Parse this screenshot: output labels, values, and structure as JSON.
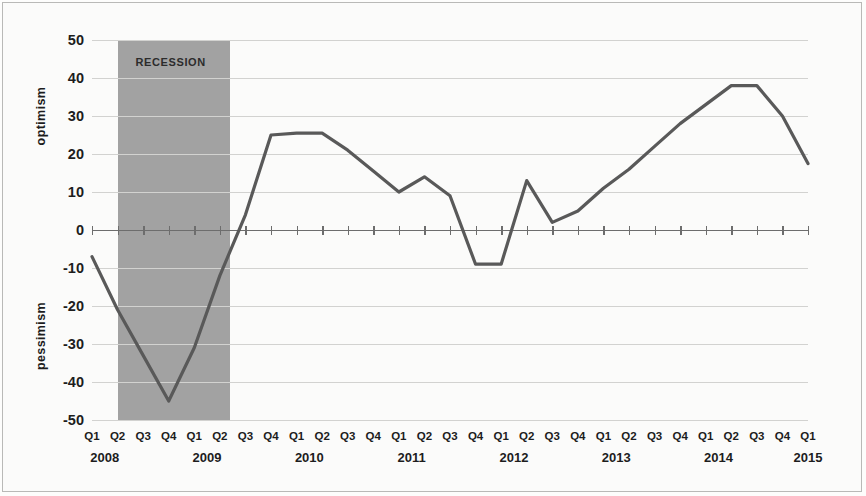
{
  "chart_data": {
    "type": "line",
    "title": "",
    "subtitle": "",
    "xlabel": "",
    "ylabel_top": "optimism",
    "ylabel_bottom": "pessimism",
    "ylim": [
      -50,
      50
    ],
    "ytick_values": [
      50,
      40,
      30,
      20,
      10,
      0,
      -10,
      -20,
      -30,
      -40,
      -50
    ],
    "ytick_labels": [
      "50",
      "40",
      "30",
      "20",
      "10",
      "0",
      "-10",
      "-20",
      "-30",
      "-40",
      "-50"
    ],
    "grid": true,
    "legend": "none",
    "line_color": "#595959",
    "band_color": "#9a9a9a",
    "quarter_labels": [
      "Q1",
      "Q2",
      "Q3",
      "Q4",
      "Q1",
      "Q2",
      "Q3",
      "Q4",
      "Q1",
      "Q2",
      "Q3",
      "Q4",
      "Q1",
      "Q2",
      "Q3",
      "Q4",
      "Q1",
      "Q2",
      "Q3",
      "Q4",
      "Q1",
      "Q2",
      "Q3",
      "Q4",
      "Q1",
      "Q2",
      "Q3",
      "Q4",
      "Q1"
    ],
    "year_labels": [
      "2008",
      "2009",
      "2010",
      "2011",
      "2012",
      "2013",
      "2014",
      "2015"
    ],
    "year_positions": [
      0.5,
      4.5,
      8.5,
      12.5,
      16.5,
      20.5,
      24.5,
      28
    ],
    "categories": [
      "Q1 2008",
      "Q2 2008",
      "Q3 2008",
      "Q4 2008",
      "Q1 2009",
      "Q2 2009",
      "Q3 2009",
      "Q4 2009",
      "Q1 2010",
      "Q2 2010",
      "Q3 2010",
      "Q4 2010",
      "Q1 2011",
      "Q2 2011",
      "Q3 2011",
      "Q4 2011",
      "Q1 2012",
      "Q2 2012",
      "Q3 2012",
      "Q4 2012",
      "Q1 2013",
      "Q2 2013",
      "Q3 2013",
      "Q4 2013",
      "Q1 2014",
      "Q2 2014",
      "Q3 2014",
      "Q4 2014",
      "Q1 2015"
    ],
    "values": [
      -7,
      -21,
      -33,
      -45,
      -31,
      -12,
      4,
      25,
      25.5,
      25.5,
      21,
      15.5,
      10,
      14,
      9,
      -9,
      -9,
      13,
      2,
      5,
      11,
      16,
      22,
      28,
      33,
      38,
      38,
      30,
      17.5
    ],
    "annotations": [
      {
        "text": "RECESSION",
        "type": "shaded-band",
        "start_category": "Q2 2008",
        "end_category": "Q2 2009"
      }
    ]
  },
  "band": {
    "label": "RECESSION"
  }
}
